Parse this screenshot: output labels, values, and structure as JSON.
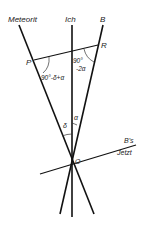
{
  "labels": {
    "meteorit": "Meteorit",
    "ich": "Ich",
    "b": "B",
    "p": "P",
    "r": "R",
    "o": "O",
    "angle_p": "90°-δ+α",
    "angle_r_top": "90°",
    "angle_r_bottom": "-2α",
    "delta": "δ",
    "alpha": "α",
    "bs": "B's",
    "jetzt": "Jetzt"
  },
  "colors": {
    "line": "#111111",
    "text": "#222222"
  }
}
